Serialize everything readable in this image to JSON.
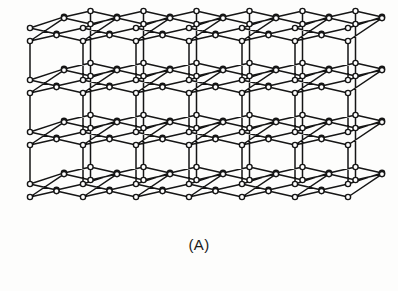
{
  "figure": {
    "caption": "(A)",
    "kind": "crystal-lattice-diagram"
  },
  "chart_data": {
    "type": "diagram",
    "subtitle": "(A)",
    "projection": "oblique-parallel",
    "node_count_approx": 230,
    "layer_count": 4,
    "atoms_per_row": 13,
    "rows_per_sheet": 2,
    "colors": {
      "background": "#fdfdfc",
      "bond": "#151515",
      "node_fill": "#ffffff",
      "node_stroke": "#151515",
      "caption": "#1a1a1a"
    },
    "geometry": {
      "origin_x": 30,
      "origin_y": 28,
      "cell_dx": 26.5,
      "zigzag_dy": 14,
      "depth_dx": 34,
      "depth_dy": -17,
      "layer_dy": 52,
      "sheet_split_dy": 13,
      "node_radius": 2.6,
      "bond_width": 1.5
    },
    "axis_ranges": {
      "x": [
        25,
        378
      ],
      "y": [
        14,
        216
      ]
    },
    "grid": false,
    "legend": null
  }
}
